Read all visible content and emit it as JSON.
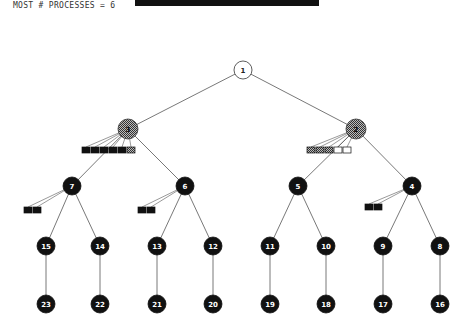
{
  "header": {
    "label": "MOST # PROCESSES = 6",
    "progress_bar_color": "#111111"
  },
  "tree": {
    "root": {
      "id": "1",
      "x": 243,
      "y": 70,
      "style": "empty"
    },
    "level1": [
      {
        "id": "3",
        "x": 128,
        "y": 129,
        "style": "hatched"
      },
      {
        "id": "2",
        "x": 356,
        "y": 129,
        "style": "hatched"
      }
    ],
    "level2": [
      {
        "id": "7",
        "x": 72,
        "y": 186,
        "parent": 0
      },
      {
        "id": "6",
        "x": 185,
        "y": 186,
        "parent": 0
      },
      {
        "id": "5",
        "x": 298,
        "y": 186,
        "parent": 1
      },
      {
        "id": "4",
        "x": 412,
        "y": 186,
        "parent": 1
      }
    ],
    "level3": [
      {
        "id": "15",
        "x": 46,
        "y": 246,
        "parent": 0
      },
      {
        "id": "14",
        "x": 100,
        "y": 246,
        "parent": 0
      },
      {
        "id": "13",
        "x": 157,
        "y": 246,
        "parent": 1
      },
      {
        "id": "12",
        "x": 213,
        "y": 246,
        "parent": 1
      },
      {
        "id": "11",
        "x": 270,
        "y": 246,
        "parent": 2
      },
      {
        "id": "10",
        "x": 326,
        "y": 246,
        "parent": 2
      },
      {
        "id": "9",
        "x": 383,
        "y": 246,
        "parent": 3
      },
      {
        "id": "8",
        "x": 440,
        "y": 246,
        "parent": 3
      }
    ],
    "level4": [
      {
        "id": "23",
        "x": 46,
        "y": 304
      },
      {
        "id": "22",
        "x": 100,
        "y": 304
      },
      {
        "id": "21",
        "x": 157,
        "y": 304
      },
      {
        "id": "20",
        "x": 213,
        "y": 304
      },
      {
        "id": "19",
        "x": 270,
        "y": 304
      },
      {
        "id": "18",
        "x": 326,
        "y": 304
      },
      {
        "id": "17",
        "x": 383,
        "y": 304
      },
      {
        "id": "16",
        "x": 440,
        "y": 304
      }
    ],
    "process_groups": [
      {
        "owner": "3",
        "x": 82,
        "y": 147,
        "boxes": [
          "black",
          "black",
          "black",
          "black",
          "black",
          "hatched"
        ]
      },
      {
        "owner": "2",
        "x": 307,
        "y": 147,
        "boxes": [
          "hatched",
          "hatched",
          "hatched",
          "empty",
          "empty"
        ]
      },
      {
        "owner": "7",
        "x": 24,
        "y": 207,
        "boxes": [
          "black",
          "black"
        ]
      },
      {
        "owner": "6",
        "x": 138,
        "y": 207,
        "boxes": [
          "black",
          "black"
        ]
      },
      {
        "owner": "4",
        "x": 365,
        "y": 204,
        "boxes": [
          "black",
          "black"
        ]
      }
    ]
  }
}
